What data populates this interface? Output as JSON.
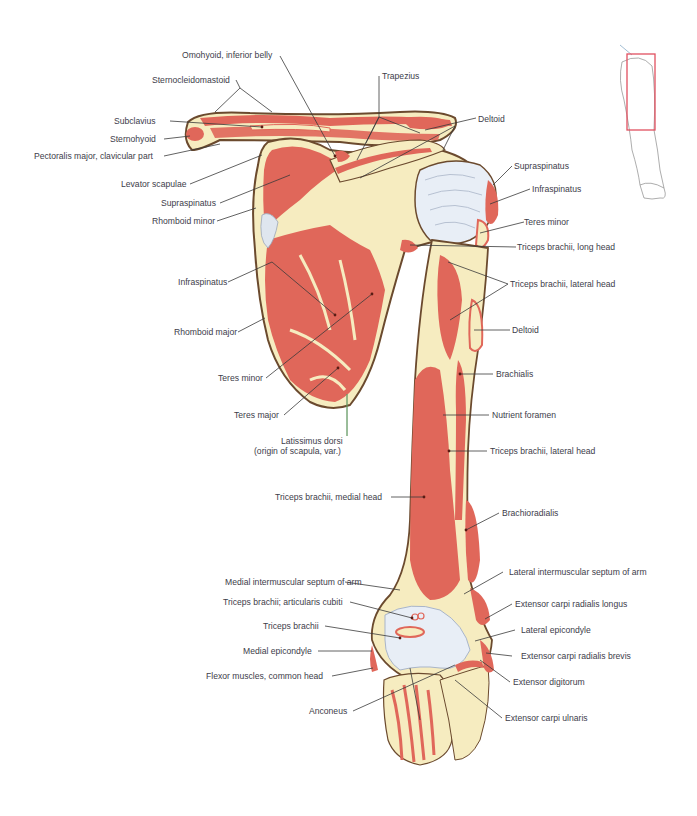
{
  "figure": {
    "colors": {
      "muscle": "#e0675a",
      "bone": "#f6ecc0",
      "outline": "#6b4a2e",
      "cartilage": "#e8eef6",
      "leader_line": "#3a3a3a",
      "label_text": "#3d3d4a",
      "orientation_box": "#e05060"
    },
    "orientation_inset": {
      "description": "Outline of right upper limb with highlighted region box",
      "box_color": "#e05060"
    }
  },
  "labels": {
    "left": [
      {
        "id": "omohyoid",
        "text": "Omohyoid, inferior belly"
      },
      {
        "id": "sternocleidomastoid",
        "text": "Sternocleidomastoid"
      },
      {
        "id": "subclavius",
        "text": "Subclavius"
      },
      {
        "id": "sternohyoid",
        "text": "Sternohyoid"
      },
      {
        "id": "pectoralis_major",
        "text": "Pectoralis major, clavicular part"
      },
      {
        "id": "levator_scapulae",
        "text": "Levator scapulae"
      },
      {
        "id": "supraspinatus_l",
        "text": "Supraspinatus"
      },
      {
        "id": "rhomboid_minor",
        "text": "Rhomboid minor"
      },
      {
        "id": "infraspinatus_l",
        "text": "Infraspinatus"
      },
      {
        "id": "rhomboid_major",
        "text": "Rhomboid major"
      },
      {
        "id": "teres_minor_l",
        "text": "Teres minor"
      },
      {
        "id": "teres_major",
        "text": "Teres major"
      },
      {
        "id": "latissimus_dorsi",
        "text": "Latissimus dorsi"
      },
      {
        "id": "latissimus_dorsi_note",
        "text": "(origin of scapula, var.)"
      },
      {
        "id": "triceps_medial",
        "text": "Triceps brachii, medial head"
      },
      {
        "id": "medial_septum",
        "text": "Medial intermuscular septum of arm"
      },
      {
        "id": "articularis_cubiti",
        "text": "Triceps brachii; articularis cubiti"
      },
      {
        "id": "triceps_brachii",
        "text": "Triceps brachii"
      },
      {
        "id": "medial_epicondyle",
        "text": "Medial epicondyle"
      },
      {
        "id": "flexor_common",
        "text": "Flexor muscles, common head"
      },
      {
        "id": "anconeus",
        "text": "Anconeus"
      }
    ],
    "right": [
      {
        "id": "trapezius",
        "text": "Trapezius"
      },
      {
        "id": "deltoid_top",
        "text": "Deltoid"
      },
      {
        "id": "supraspinatus_r",
        "text": "Supraspinatus"
      },
      {
        "id": "infraspinatus_r",
        "text": "Infraspinatus"
      },
      {
        "id": "teres_minor_r",
        "text": "Teres minor"
      },
      {
        "id": "triceps_long",
        "text": "Triceps brachii, long head"
      },
      {
        "id": "triceps_lateral_1",
        "text": "Triceps brachii, lateral head"
      },
      {
        "id": "deltoid_arm",
        "text": "Deltoid"
      },
      {
        "id": "brachialis",
        "text": "Brachialis"
      },
      {
        "id": "nutrient_foramen",
        "text": "Nutrient foramen"
      },
      {
        "id": "triceps_lateral_2",
        "text": "Triceps brachii, lateral head"
      },
      {
        "id": "brachioradialis",
        "text": "Brachioradialis"
      },
      {
        "id": "lateral_septum",
        "text": "Lateral intermuscular septum of arm"
      },
      {
        "id": "ecrl",
        "text": "Extensor carpi radialis longus"
      },
      {
        "id": "lateral_epicondyle",
        "text": "Lateral epicondyle"
      },
      {
        "id": "ecrb",
        "text": "Extensor carpi radialis brevis"
      },
      {
        "id": "extensor_digitorum",
        "text": "Extensor digitorum"
      },
      {
        "id": "ecu",
        "text": "Extensor carpi ulnaris"
      }
    ]
  }
}
